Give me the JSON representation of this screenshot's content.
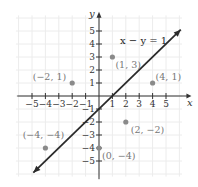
{
  "chart_data": {
    "type": "line",
    "title": "",
    "xlabel": "x",
    "ylabel": "y",
    "xlim": [
      -6,
      6
    ],
    "ylim": [
      -6,
      6
    ],
    "grid": true,
    "x_ticks": [
      -5,
      -4,
      -3,
      -2,
      -1,
      1,
      2,
      3,
      4,
      5
    ],
    "y_ticks": [
      -5,
      -4,
      -3,
      -2,
      -1,
      1,
      2,
      3,
      4,
      5
    ],
    "x_tick_labels": [
      "−5",
      "−4",
      "−3",
      "−2",
      "−1",
      "1",
      "2",
      "3",
      "4",
      "5"
    ],
    "y_tick_labels": [
      "−5",
      "−4",
      "−3",
      "−2",
      "−1",
      "1",
      "2",
      "3",
      "4",
      "5"
    ],
    "line": {
      "equation": "x − y = 1",
      "x": [
        -4.9,
        6.1
      ],
      "y": [
        -5.9,
        5.1
      ]
    },
    "points": [
      {
        "x": 1,
        "y": 3,
        "label": "(1, 3)"
      },
      {
        "x": -2,
        "y": 1,
        "label": "(−2, 1)"
      },
      {
        "x": 4,
        "y": 1,
        "label": "(4, 1)"
      },
      {
        "x": 2,
        "y": -2,
        "label": "(2, −2)"
      },
      {
        "x": -4,
        "y": -4,
        "label": "(−4, −4)"
      },
      {
        "x": 0,
        "y": -4,
        "label": "(0, −4)"
      }
    ],
    "colors": {
      "line": "#2a2a2a",
      "points": "#8a8a8a",
      "grid": "#ececec",
      "axes": "#333333"
    }
  }
}
